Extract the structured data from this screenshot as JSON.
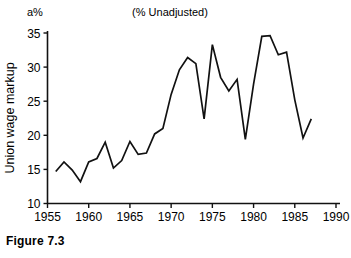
{
  "figure": {
    "caption": "Figure 7.3",
    "unit_label": "a%"
  },
  "chart_data": {
    "type": "line",
    "title": "(% Unadjusted)",
    "xlabel": "",
    "ylabel": "Union wage markup",
    "xlim": [
      1955,
      1990
    ],
    "ylim": [
      10,
      35
    ],
    "xticks": [
      1955,
      1960,
      1965,
      1970,
      1975,
      1980,
      1985,
      1990
    ],
    "yticks": [
      10,
      15,
      20,
      25,
      30,
      35
    ],
    "grid": false,
    "legend": "none",
    "series": [
      {
        "name": "Union wage markup",
        "color": "#111111",
        "x": [
          1956,
          1957,
          1958,
          1959,
          1960,
          1961,
          1962,
          1963,
          1964,
          1965,
          1966,
          1967,
          1968,
          1969,
          1970,
          1971,
          1972,
          1973,
          1974,
          1975,
          1976,
          1977,
          1978,
          1979,
          1980,
          1981,
          1982,
          1983,
          1984,
          1985,
          1986,
          1987
        ],
        "values": [
          14.7,
          16.1,
          14.9,
          13.2,
          16.1,
          16.6,
          19.0,
          15.2,
          16.3,
          19.1,
          17.2,
          17.4,
          20.2,
          21.0,
          26.0,
          29.6,
          31.4,
          30.5,
          22.4,
          33.3,
          28.5,
          26.5,
          28.2,
          19.4,
          27.5,
          34.5,
          34.6,
          31.8,
          32.2,
          25.2,
          19.6,
          22.4
        ]
      }
    ]
  }
}
